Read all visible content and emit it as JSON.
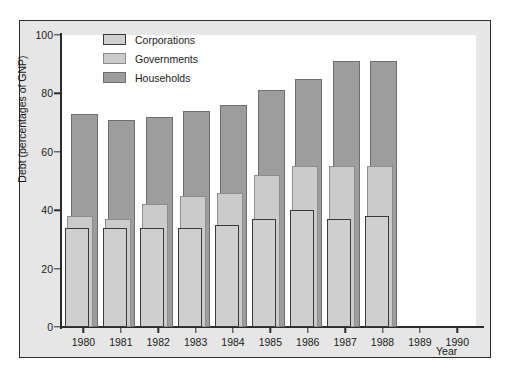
{
  "chart_data": {
    "type": "bar",
    "subtype": "overlapping-grouped",
    "title": "",
    "xlabel": "Year",
    "ylabel": "Debt (percentages of GNP)",
    "categories": [
      "1980",
      "1981",
      "1982",
      "1983",
      "1984",
      "1985",
      "1986",
      "1987",
      "1988",
      "1989",
      "1990"
    ],
    "x": [
      1980,
      1981,
      1982,
      1983,
      1984,
      1985,
      1986,
      1987,
      1988,
      1989,
      1990
    ],
    "series": [
      {
        "name": "Households",
        "color": "#9d9d9d",
        "values": [
          73,
          71,
          72,
          74,
          76,
          81,
          85,
          91,
          91,
          null,
          null
        ]
      },
      {
        "name": "Governments",
        "color": "#cbcbcb",
        "values": [
          38,
          37,
          42,
          45,
          46,
          52,
          55,
          55,
          55,
          null,
          null
        ]
      },
      {
        "name": "Corporations",
        "color": "#cfcfcf",
        "values": [
          34,
          34,
          34,
          34,
          35,
          37,
          40,
          37,
          38,
          null,
          null
        ]
      }
    ],
    "ylim": [
      0,
      100
    ],
    "yticks": [
      0,
      20,
      40,
      60,
      80,
      100
    ],
    "ytick_labels": [
      "0",
      "20",
      "40",
      "60",
      "80",
      "100"
    ],
    "xlim": [
      1979.4,
      1990.5
    ],
    "grid": false,
    "legend": {
      "position": "top-left-inside",
      "entries": [
        "Corporations",
        "Governments",
        "Households"
      ]
    },
    "plot_background": "#ffffff",
    "figure_background": "#e6e6e6",
    "frame_color": "#2b2b2b",
    "axis_text_color": "#1a1a1a"
  }
}
